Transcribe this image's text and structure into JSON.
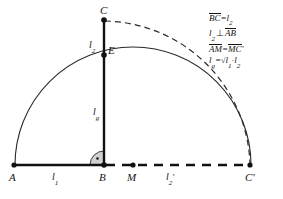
{
  "figure": {
    "type": "geometric-construction",
    "background_color": "#ffffff",
    "stroke_color": "#141414"
  },
  "points": [
    {
      "id": "A",
      "label": "A",
      "x": 14,
      "y": 165
    },
    {
      "id": "B",
      "label": "B",
      "x": 104,
      "y": 165
    },
    {
      "id": "M",
      "label": "M",
      "x": 133,
      "y": 165
    },
    {
      "id": "C2",
      "label": "C'",
      "x": 250,
      "y": 165
    },
    {
      "id": "C",
      "label": "C",
      "x": 104,
      "y": 20
    },
    {
      "id": "E",
      "label": "E",
      "x": 104,
      "y": 55
    }
  ],
  "segment_labels": {
    "l1": {
      "base": "l",
      "sub": "1",
      "prime": ""
    },
    "l2_base": {
      "base": "l",
      "sub": "2",
      "prime": "'"
    },
    "l2_vert": {
      "base": "l",
      "sub": "2",
      "prime": ""
    },
    "lg": {
      "base": "l",
      "sub": "g",
      "prime": ""
    }
  },
  "annotations": [
    {
      "id": "line-1",
      "text": "BC = l2",
      "parts": {
        "over1": "BC",
        "eq": "=",
        "base": "l",
        "sub": "2"
      }
    },
    {
      "id": "line-2",
      "text": "l2 ⊥ AB",
      "parts": {
        "base": "l",
        "sub": "2",
        "perp": "⊥",
        "over2": "AB"
      }
    },
    {
      "id": "line-3",
      "text": "AM = MC'",
      "parts": {
        "over1": "AM",
        "eq": "=",
        "over2": "MC",
        "prime": "'"
      }
    },
    {
      "id": "line-4",
      "text": "lg = √(l1 · l2)",
      "parts": {
        "base": "l",
        "sub": "g",
        "eq": "=",
        "radical": "√",
        "r1": "l",
        "r1sub": "1",
        "dot": "·",
        "r2": "l",
        "r2sub": "2"
      }
    }
  ],
  "right_angle": {
    "at": "B",
    "marker": "quarter-arc-with-dot",
    "radius": 14
  },
  "semicircle": {
    "center": "M",
    "radius": 118,
    "from": "A",
    "to": "C'",
    "style": "solid"
  },
  "dashed_arc": {
    "center": "M",
    "radius": 148,
    "from": "C",
    "to": "C'",
    "style": "dashed"
  },
  "baseline_solid": {
    "from": "A",
    "to": "B",
    "style": "solid-thick"
  },
  "baseline_dashed": {
    "from": "B",
    "to": "C'",
    "style": "dashed-thick"
  },
  "vertical_line": {
    "from": "B",
    "to": "C",
    "style": "solid-thick"
  }
}
